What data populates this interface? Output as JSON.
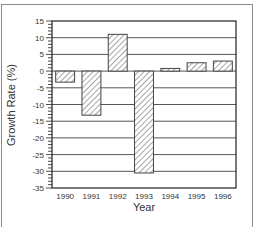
{
  "chart_data": {
    "type": "bar",
    "title": "",
    "xlabel": "Year",
    "ylabel": "Growth Rate (%)",
    "categories": [
      "1990",
      "1991",
      "1992",
      "1993",
      "1994",
      "1995",
      "1996"
    ],
    "values": [
      -3.3,
      -13.2,
      11.0,
      -30.5,
      0.8,
      2.5,
      3.0
    ],
    "ylim": [
      -35,
      15
    ],
    "yticks": [
      15,
      10,
      5,
      0,
      -5,
      -10,
      -15,
      -20,
      -25,
      -30,
      -35
    ],
    "grid": true,
    "bar_fill": "hatched",
    "legend": null
  },
  "colors": {
    "axis": "#222222",
    "grid": "#555555",
    "bar_stroke": "#444444",
    "hatch": "#666666",
    "frame": "#8a8a8a"
  }
}
